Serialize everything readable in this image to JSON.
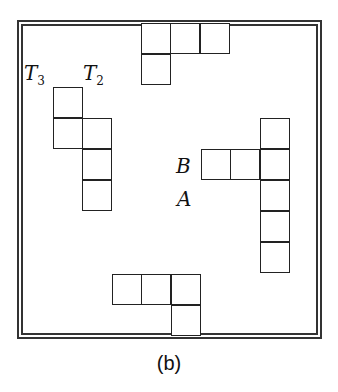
{
  "caption": "(b)",
  "labels": {
    "t3": {
      "base": "T",
      "sub": "3"
    },
    "t2": {
      "base": "T",
      "sub": "2"
    },
    "b": "B",
    "a": "A"
  },
  "cell_size": [
    30,
    31
  ],
  "pieces": [
    {
      "name": "top-piece",
      "cells": [
        [
          141,
          23
        ],
        [
          170,
          23
        ],
        [
          200,
          23
        ],
        [
          141,
          54
        ]
      ]
    },
    {
      "name": "t3-piece",
      "cells": [
        [
          53,
          87
        ],
        [
          53,
          118
        ]
      ]
    },
    {
      "name": "t2-piece",
      "cells": [
        [
          82,
          118
        ],
        [
          82,
          149
        ],
        [
          82,
          180
        ]
      ]
    },
    {
      "name": "b-row-piece",
      "cells": [
        [
          201,
          149
        ],
        [
          230,
          149
        ]
      ]
    },
    {
      "name": "right-column-piece",
      "cells": [
        [
          260,
          118
        ],
        [
          260,
          149
        ],
        [
          260,
          180
        ],
        [
          260,
          211
        ],
        [
          260,
          242
        ]
      ]
    },
    {
      "name": "bottom-piece",
      "cells": [
        [
          112,
          274
        ],
        [
          141,
          274
        ],
        [
          171,
          274
        ],
        [
          171,
          305
        ]
      ]
    }
  ]
}
